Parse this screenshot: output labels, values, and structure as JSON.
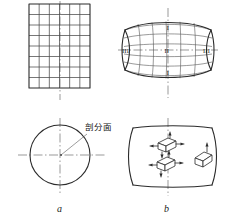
{
  "figure": {
    "title_caption_a": "a",
    "title_caption_b": "b",
    "annotation_text": "剖分面",
    "roman_labels": {
      "left": "III",
      "center": "II",
      "right": "III",
      "top": "I",
      "bottom": "I"
    },
    "colors": {
      "line": "#2b2b2b",
      "grid": "#4a4a4a",
      "centerline": "#6e6e6e",
      "background": "#ffffff"
    },
    "panels": [
      {
        "name": "undeformed-grid",
        "shape": "rectangle",
        "columns": 6,
        "rows": 8,
        "x": 29,
        "y": 4,
        "width": 61,
        "height": 84
      },
      {
        "name": "deformed-grid",
        "shape": "barrel",
        "columns": 6,
        "rows": 6,
        "x": 124,
        "y": 21,
        "width": 88,
        "height": 57
      },
      {
        "name": "circular-section",
        "shape": "circle",
        "cx": 60,
        "cy": 155,
        "r": 30
      },
      {
        "name": "deformed-section",
        "shape": "barrel-side",
        "x": 130,
        "y": 128,
        "width": 83,
        "height": 57
      }
    ],
    "stress_elements": [
      {
        "name": "stress-cube-upper",
        "cx": 166,
        "cy": 140
      },
      {
        "name": "stress-cube-lower",
        "cx": 165,
        "cy": 160
      },
      {
        "name": "stress-cube-right",
        "cx": 202,
        "cy": 156
      }
    ]
  }
}
